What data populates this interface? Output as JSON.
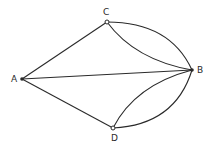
{
  "diagram": {
    "type": "multigraph",
    "nodes": [
      {
        "id": "A",
        "label": "A",
        "x": 22,
        "y": 79
      },
      {
        "id": "B",
        "label": "B",
        "x": 192,
        "y": 70
      },
      {
        "id": "C",
        "label": "C",
        "x": 107,
        "y": 22
      },
      {
        "id": "D",
        "label": "D",
        "x": 113,
        "y": 128
      }
    ],
    "edges": [
      {
        "from": "A",
        "to": "C",
        "shape": "straight"
      },
      {
        "from": "A",
        "to": "D",
        "shape": "straight"
      },
      {
        "from": "A",
        "to": "B",
        "shape": "straight"
      },
      {
        "from": "C",
        "to": "B",
        "shape": "curve-outer"
      },
      {
        "from": "C",
        "to": "B",
        "shape": "curve-inner"
      },
      {
        "from": "D",
        "to": "B",
        "shape": "curve-outer"
      },
      {
        "from": "D",
        "to": "B",
        "shape": "curve-inner"
      }
    ]
  }
}
